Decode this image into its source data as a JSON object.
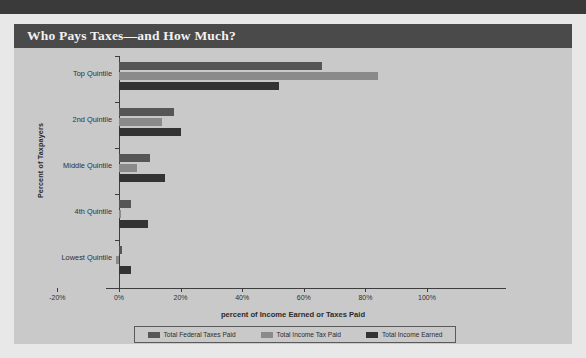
{
  "title": "Who Pays Taxes—and How Much?",
  "chart_data": {
    "type": "bar",
    "orientation": "horizontal",
    "title": "Who Pays Taxes—and How Much?",
    "xlabel": "percent of Income Earned or Taxes Paid",
    "ylabel": "Percent of Taxpayers",
    "categories": [
      "Top Quintile",
      "2nd Quintile",
      "Middle Quintile",
      "4th Quintile",
      "Lowest Quintile"
    ],
    "series": [
      {
        "name": "Total Federal Taxes Paid",
        "color": "#565656",
        "values": [
          66,
          18,
          10,
          4,
          1
        ]
      },
      {
        "name": "Total Income Tax Paid",
        "color": "#8a8a8a",
        "values": [
          84,
          14,
          6,
          0.5,
          -1
        ]
      },
      {
        "name": "Total Income Earned",
        "color": "#333333",
        "values": [
          52,
          20,
          15,
          9.5,
          4
        ]
      }
    ],
    "xticks": [
      "-20%",
      "0%",
      "20%",
      "40%",
      "60%",
      "80%",
      "100%"
    ],
    "xtick_values": [
      -20,
      0,
      20,
      40,
      60,
      80,
      100
    ],
    "xlim": [
      -20,
      100
    ],
    "grid": false,
    "legend_position": "bottom"
  },
  "colors": {
    "panel_background": "#c9c9c9",
    "page_background": "#e8e8e8",
    "title_bar": "#4a4a4a",
    "title_text": "#f2f2f2",
    "axis": "#3d3d3d",
    "top_band": "#3a3a3a"
  }
}
